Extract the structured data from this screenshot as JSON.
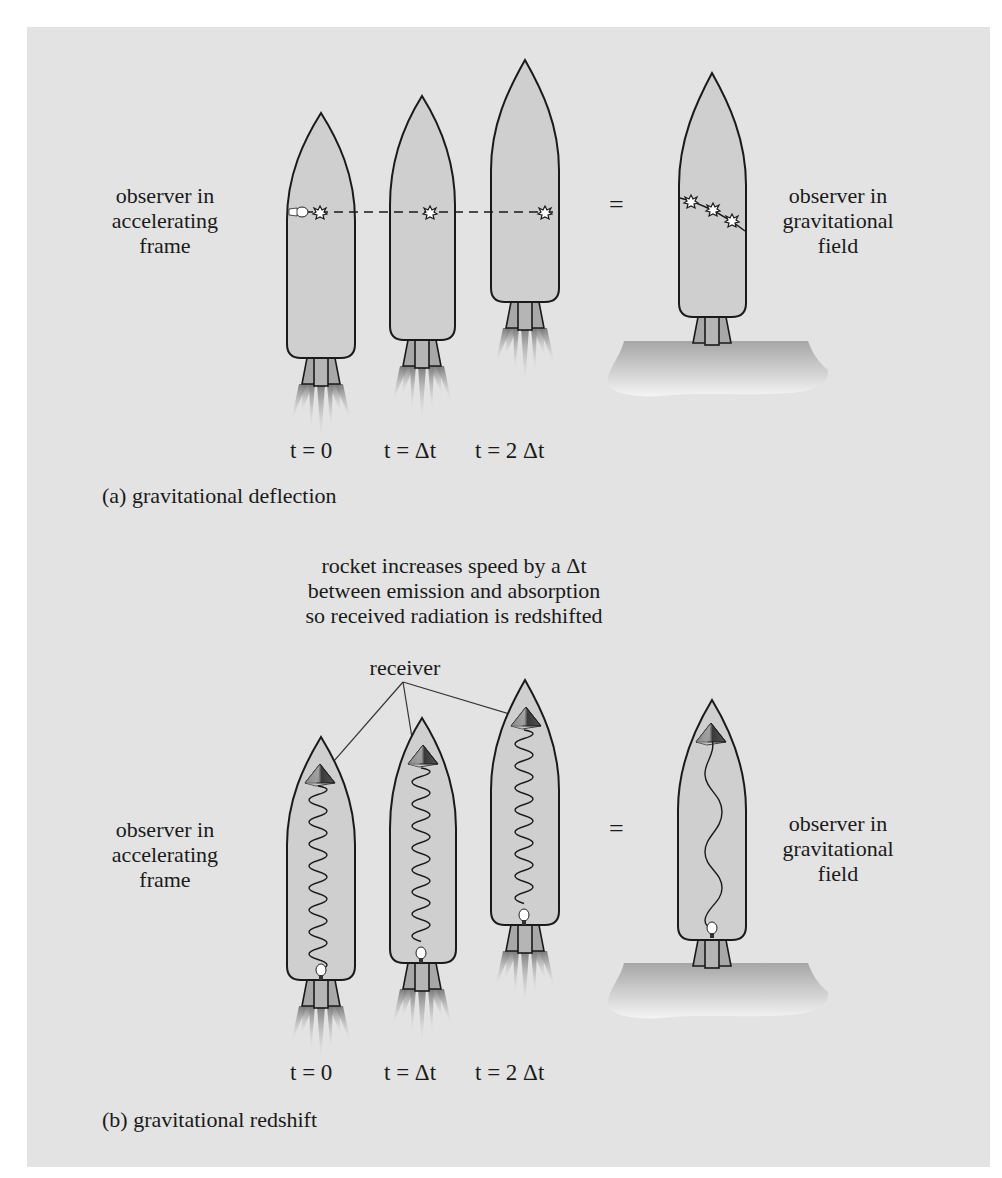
{
  "panel_a": {
    "left_label": [
      "observer in",
      "accelerating",
      "frame"
    ],
    "right_label": [
      "observer in",
      "gravitational",
      "field"
    ],
    "equals": "=",
    "times": [
      "t = 0",
      "t = Δt",
      "t = 2 Δt"
    ],
    "caption": "(a) gravitational deflection"
  },
  "panel_b": {
    "annotation": [
      "rocket increases speed by a Δt",
      "between emission and absorption",
      "so received radiation is redshifted"
    ],
    "receiver_label": "receiver",
    "left_label": [
      "observer in",
      "accelerating",
      "frame"
    ],
    "right_label": [
      "observer in",
      "gravitational",
      "field"
    ],
    "equals": "=",
    "times": [
      "t = 0",
      "t = Δt",
      "t = 2 Δt"
    ],
    "caption": "(b) gravitational redshift"
  },
  "colors": {
    "panel_bg": "#e3e3e3",
    "rocket_fill": "#cfcfcf",
    "outline": "#1a1a1a",
    "nozzle": "#a8a8a8",
    "ground_top": "#a9a9a9",
    "ground_bottom": "#f2f2f2"
  }
}
